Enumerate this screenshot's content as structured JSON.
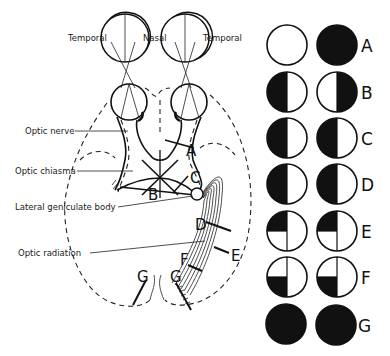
{
  "diagram": {
    "eye_labels": {
      "left_temporal": "Temporal",
      "nasal": "Nasal",
      "right_temporal": "Temporal"
    },
    "structure_labels": {
      "optic_nerve": "Optic nerve",
      "optic_chiasma": "Optic chiasma",
      "lateral_geniculate_body": "Lateral geniculate body",
      "optic_radiation": "Optic radiation"
    },
    "lesion_markers": {
      "A": "A",
      "B": "B",
      "C": "C",
      "D": "D",
      "E": "E",
      "F": "F",
      "G_left": "G",
      "G_right": "G"
    },
    "field_defects": [
      {
        "label": "A",
        "left_eye": "full-field intact (white)",
        "right_eye": "complete blindness (black)"
      },
      {
        "label": "B",
        "left_eye": "left (temporal) half black",
        "right_eye": "right (temporal) half black"
      },
      {
        "label": "C",
        "left_eye": "left half black",
        "right_eye": "left half black"
      },
      {
        "label": "D",
        "left_eye": "left half black",
        "right_eye": "left half black"
      },
      {
        "label": "E",
        "left_eye": "upper-left quadrant black",
        "right_eye": "upper-left quadrant black"
      },
      {
        "label": "F",
        "left_eye": "lower-left quadrant black",
        "right_eye": "lower-left quadrant black"
      },
      {
        "label": "G",
        "left_eye": "complete black",
        "right_eye": "complete black"
      }
    ],
    "colors": {
      "ink": "#111111",
      "background": "#ffffff"
    }
  }
}
